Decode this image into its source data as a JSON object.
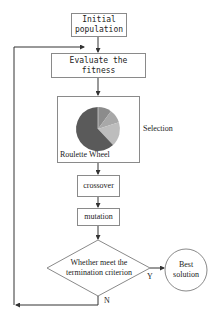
{
  "diagram": {
    "type": "flowchart",
    "nodes": {
      "initial_population": {
        "line1": "Initial",
        "line2": "population"
      },
      "evaluate_fitness": {
        "line1": "Evaluate the",
        "line2": "fitness"
      },
      "selection": {
        "caption": "Roulette Wheel",
        "side_label": "Selection"
      },
      "crossover": {
        "label": "crossover"
      },
      "mutation": {
        "label": "mutation"
      },
      "decision": {
        "line1": "Whether meet the",
        "line2": "termination criterion"
      },
      "best_solution": {
        "line1": "Best",
        "line2": "solution"
      }
    },
    "edge_labels": {
      "yes": "Y",
      "no": "N"
    },
    "roulette_slices": [
      {
        "portion": 0.62,
        "color": "#5a5a5a"
      },
      {
        "portion": 0.1,
        "color": "#8c8c8c"
      },
      {
        "portion": 0.1,
        "color": "#a8a8a8"
      },
      {
        "portion": 0.18,
        "color": "#bdbdbd"
      }
    ],
    "colors": {
      "line": "#333333",
      "border": "#8a8a8a"
    }
  }
}
